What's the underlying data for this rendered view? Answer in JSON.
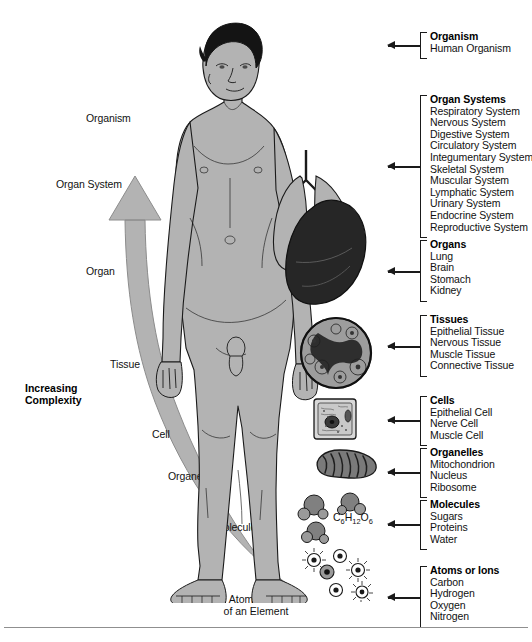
{
  "diagram": {
    "complexity_axis": {
      "label": "Increasing Complexity",
      "direction": "upward",
      "tick_labels": [
        "Organism",
        "Organ System",
        "Organ",
        "Tissue",
        "Cell",
        "Organelle",
        "Molecule"
      ],
      "arrow_tail_caption": "Atom or Ion\nof an Element",
      "arrow_tail_caption_line1": "Atom or Ion",
      "arrow_tail_caption_line2": "of an Element"
    },
    "molecule_formula_prefix": "C",
    "molecule_formula": "C6H12O6",
    "formula_parts": {
      "c": "C",
      "c_sub": "6",
      "h": "H",
      "h_sub": "12",
      "o": "O",
      "o_sub": "6"
    },
    "colors": {
      "body_fill": "#b3b3b3",
      "arrow_fill": "#b0b0b0",
      "ink": "#1a1a1a",
      "dark_organ": "#2b2b2b",
      "background": "#ffffff",
      "rule": "#8f8f8f"
    },
    "groups": [
      {
        "id": "organism",
        "heading": "Organism",
        "items": [
          "Human Organism"
        ]
      },
      {
        "id": "organ-systems",
        "heading": "Organ Systems",
        "items": [
          "Respiratory System",
          "Nervous System",
          "Digestive System",
          "Circulatory System",
          "Integumentary System",
          "Skeletal System",
          "Muscular System",
          "Lymphatic System",
          "Urinary System",
          "Endocrine System",
          "Reproductive System"
        ]
      },
      {
        "id": "organs",
        "heading": "Organs",
        "items": [
          "Lung",
          "Brain",
          "Stomach",
          "Kidney"
        ]
      },
      {
        "id": "tissues",
        "heading": "Tissues",
        "items": [
          "Epithelial Tissue",
          "Nervous Tissue",
          "Muscle Tissue",
          "Connective Tissue"
        ]
      },
      {
        "id": "cells",
        "heading": "Cells",
        "items": [
          "Epithelial Cell",
          "Nerve Cell",
          "Muscle Cell"
        ]
      },
      {
        "id": "organelles",
        "heading": "Organelles",
        "items": [
          "Mitochondrion",
          "Nucleus",
          "Ribosome"
        ]
      },
      {
        "id": "molecules",
        "heading": "Molecules",
        "items": [
          "Sugars",
          "Proteins",
          "Water"
        ]
      },
      {
        "id": "atoms-or-ions",
        "heading": "Atoms or Ions",
        "items": [
          "Carbon",
          "Hydrogen",
          "Oxygen",
          "Nitrogen"
        ]
      }
    ],
    "illustrations": [
      {
        "id": "human-figure",
        "name": "standing-human-body-illustration"
      },
      {
        "id": "lungs",
        "name": "lungs-organ-illustration"
      },
      {
        "id": "tissue-section",
        "name": "tissue-micrograph-illustration"
      },
      {
        "id": "cell",
        "name": "cell-illustration"
      },
      {
        "id": "mitochondrion",
        "name": "mitochondrion-organelle-illustration"
      },
      {
        "id": "molecules-art",
        "name": "molecule-spheres-illustration"
      },
      {
        "id": "atoms-art",
        "name": "atoms-illustration"
      }
    ]
  }
}
